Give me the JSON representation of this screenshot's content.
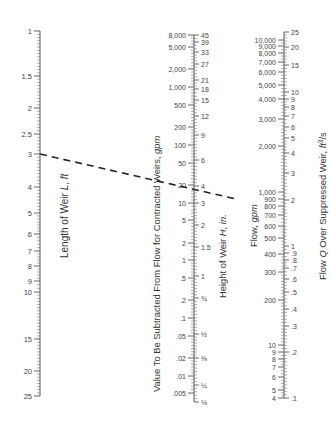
{
  "chart_data": {
    "type": "nomograph",
    "title": "",
    "scales": [
      {
        "id": "length",
        "label": "Length of Weir L, ft",
        "side": "left",
        "ticks": [
          {
            "label": "1",
            "y": 31
          },
          {
            "label": "1.5",
            "y": 76
          },
          {
            "label": "2",
            "y": 108
          },
          {
            "label": "2.5",
            "y": 134
          },
          {
            "label": "3",
            "y": 154
          },
          {
            "label": "4",
            "y": 187
          },
          {
            "label": "5",
            "y": 213
          },
          {
            "label": "6",
            "y": 234
          },
          {
            "label": "7",
            "y": 251
          },
          {
            "label": "8",
            "y": 266
          },
          {
            "label": "9",
            "y": 281
          },
          {
            "label": "10",
            "y": 292
          },
          {
            "label": "15",
            "y": 339
          },
          {
            "label": "20",
            "y": 371
          },
          {
            "label": "25",
            "y": 396
          }
        ]
      },
      {
        "id": "subtract",
        "label": "Value To Be Subtracted From Flow for Contracted Weirs, gpm",
        "side": "left",
        "ticks": [
          {
            "label": "8,000",
            "y": 35
          },
          {
            "label": "5,000",
            "y": 47
          },
          {
            "label": "2,000",
            "y": 69
          },
          {
            "label": "1,000",
            "y": 87
          },
          {
            "label": "500",
            "y": 105
          },
          {
            "label": "200",
            "y": 127
          },
          {
            "label": "100",
            "y": 145
          },
          {
            "label": "50",
            "y": 163
          },
          {
            "label": "20",
            "y": 185
          },
          {
            "label": "10",
            "y": 203
          },
          {
            "label": "5",
            "y": 220
          },
          {
            "label": "2",
            "y": 243
          },
          {
            "label": "1",
            "y": 260
          },
          {
            "label": ".5",
            "y": 278
          },
          {
            "label": ".2",
            "y": 300
          },
          {
            "label": ".1",
            "y": 318
          },
          {
            "label": ".05",
            "y": 336
          },
          {
            "label": ".02",
            "y": 358
          },
          {
            "label": ".01",
            "y": 376
          },
          {
            "label": ".005",
            "y": 393
          }
        ]
      },
      {
        "id": "height",
        "label": "Height of Weir H, in.",
        "side": "right",
        "ticks": [
          {
            "label": "45",
            "y": 35
          },
          {
            "label": "39",
            "y": 42
          },
          {
            "label": "33",
            "y": 52
          },
          {
            "label": "27",
            "y": 64
          },
          {
            "label": "21",
            "y": 80
          },
          {
            "label": "18",
            "y": 89
          },
          {
            "label": "15",
            "y": 100
          },
          {
            "label": "12",
            "y": 116
          },
          {
            "label": "9",
            "y": 135
          },
          {
            "label": "6",
            "y": 160
          },
          {
            "label": "4",
            "y": 186
          },
          {
            "label": "3",
            "y": 203
          },
          {
            "label": "2",
            "y": 225
          },
          {
            "label": "1.5",
            "y": 247
          },
          {
            "label": "1",
            "y": 276
          },
          {
            "label": "¾",
            "y": 298
          },
          {
            "label": "½",
            "y": 334
          },
          {
            "label": "⅜",
            "y": 358
          },
          {
            "label": "¼",
            "y": 385
          },
          {
            "label": "⅛",
            "y": 402
          }
        ]
      },
      {
        "id": "flow_gpm",
        "label": "Flow, gpm",
        "side": "left",
        "ticks": [
          {
            "label": "10,000",
            "y": 40
          },
          {
            "label": "9,000",
            "y": 46
          },
          {
            "label": "8,000",
            "y": 53
          },
          {
            "label": "7,000",
            "y": 62
          },
          {
            "label": "6,000",
            "y": 72
          },
          {
            "label": "5,000",
            "y": 85
          },
          {
            "label": "4,000",
            "y": 99
          },
          {
            "label": "3,000",
            "y": 119
          },
          {
            "label": "2,000",
            "y": 146
          },
          {
            "label": "1,000",
            "y": 192
          },
          {
            "label": "900",
            "y": 199
          },
          {
            "label": "800",
            "y": 206
          },
          {
            "label": "700",
            "y": 215
          },
          {
            "label": "600",
            "y": 226
          },
          {
            "label": "500",
            "y": 238
          },
          {
            "label": "400",
            "y": 254
          },
          {
            "label": "300",
            "y": 272
          },
          {
            "label": "200",
            "y": 300
          },
          {
            "label": "10",
            "y": 345
          },
          {
            "label": "9",
            "y": 352
          },
          {
            "label": "8",
            "y": 359
          },
          {
            "label": "7",
            "y": 367
          },
          {
            "label": "6",
            "y": 377
          },
          {
            "label": "5",
            "y": 390
          },
          {
            "label": "4",
            "y": 398
          }
        ]
      },
      {
        "id": "flow_cfs",
        "label": "Flow Q Over Suppressed Weir, ft³/s",
        "side": "right",
        "ticks": [
          {
            "label": "25",
            "y": 32
          },
          {
            "label": "20",
            "y": 47
          },
          {
            "label": "15",
            "y": 65
          },
          {
            "label": "10",
            "y": 92
          },
          {
            "label": "9",
            "y": 99
          },
          {
            "label": "8",
            "y": 107
          },
          {
            "label": "7",
            "y": 116
          },
          {
            "label": "6",
            "y": 127
          },
          {
            "label": "5",
            "y": 138
          },
          {
            "label": "4",
            "y": 153
          },
          {
            "label": "3",
            "y": 173
          },
          {
            "label": "2",
            "y": 200
          },
          {
            "label": "1",
            "y": 246
          },
          {
            "label": ".9",
            "y": 253
          },
          {
            "label": ".8",
            "y": 260
          },
          {
            "label": ".7",
            "y": 268
          },
          {
            "label": ".6",
            "y": 279
          },
          {
            "label": ".5",
            "y": 292
          },
          {
            "label": ".4",
            "y": 309
          },
          {
            "label": ".3",
            "y": 326
          },
          {
            "label": ".2",
            "y": 352
          },
          {
            "label": ".1",
            "y": 398
          }
        ]
      }
    ],
    "example_line": {
      "style": "dashed",
      "from": {
        "scale": "length",
        "value": "3"
      },
      "through": {
        "scale": "height",
        "value": "4"
      },
      "to_approx": {
        "scale": "flow_cfs",
        "value": "≈2",
        "gpm": "≈900"
      }
    },
    "grid": false,
    "legend": null
  }
}
